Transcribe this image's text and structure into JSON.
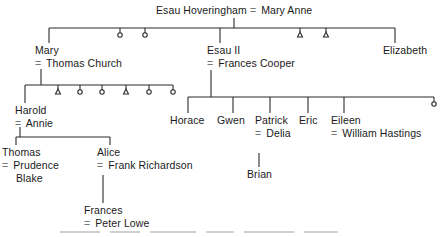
{
  "tree": {
    "root": {
      "husband": "Esau Hoveringham",
      "sep": "=",
      "wife": "Mary Anne"
    },
    "gen1": {
      "mary": {
        "name": "Mary",
        "spouse": "Thomas Church"
      },
      "esau2": {
        "name": "Esau II",
        "spouse": "Frances Cooper"
      },
      "elizabeth": {
        "name": "Elizabeth"
      },
      "unnamed_markers": [
        "circle",
        "circle",
        "triangle",
        "triangle"
      ]
    },
    "mary_children": {
      "harold": {
        "name": "Harold",
        "spouse": "Annie"
      },
      "unnamed_markers": [
        "triangle",
        "circle",
        "circle",
        "triangle",
        "circle",
        "circle"
      ]
    },
    "harold_children": {
      "thomas": {
        "name": "Thomas",
        "spouse_line1": "Prudence",
        "spouse_line2": "Blake"
      },
      "alice": {
        "name": "Alice",
        "spouse": "Frank Richardson"
      }
    },
    "alice_children": {
      "frances": {
        "name": "Frances",
        "spouse": "Peter Lowe"
      }
    },
    "esau2_children": {
      "horace": {
        "name": "Horace"
      },
      "gwen": {
        "name": "Gwen"
      },
      "patrick": {
        "name": "Patrick",
        "spouse": "Delia"
      },
      "eric": {
        "name": "Eric"
      },
      "eileen": {
        "name": "Eileen",
        "spouse": "William Hastings"
      },
      "unnamed_markers": [
        "circle"
      ]
    },
    "patrick_children": {
      "brian": {
        "name": "Brian"
      }
    },
    "marriage_symbol": "=",
    "legend": {
      "circle": "female (unnamed)",
      "triangle": "male (unnamed)"
    }
  },
  "colors": {
    "line": "#2a2a2a",
    "text": "#1a1a1a",
    "equals": "#777777"
  }
}
